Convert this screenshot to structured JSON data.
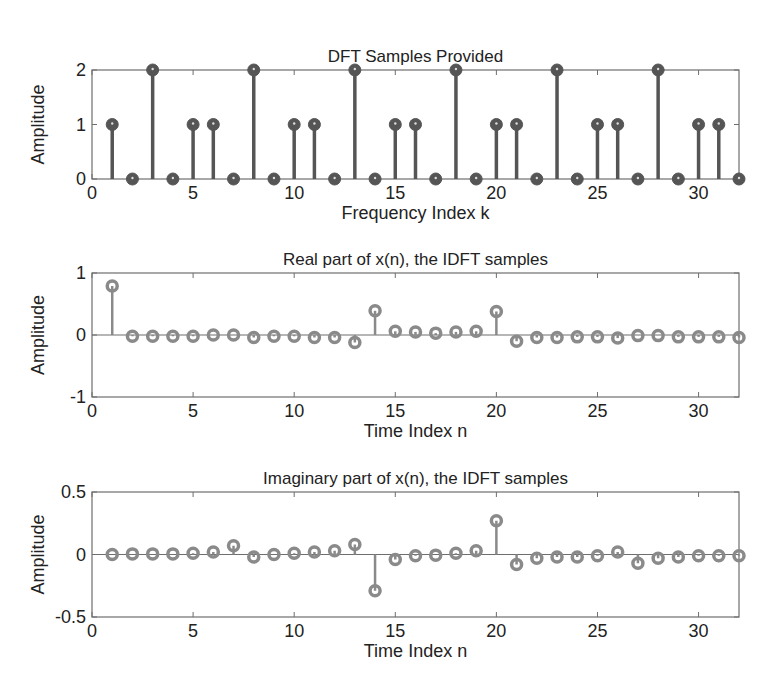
{
  "figure": {
    "background": "#ffffff",
    "axis_color": "#6e6e6e",
    "text_color": "#222222"
  },
  "chart_data": [
    {
      "id": "dft",
      "type": "stem",
      "title": "DFT Samples Provided",
      "xlabel": "Frequency Index k",
      "ylabel": "Amplitude",
      "xlim": [
        0,
        32
      ],
      "ylim": [
        0,
        2
      ],
      "xticks": [
        0,
        5,
        10,
        15,
        20,
        25,
        30
      ],
      "yticks": [
        0,
        1,
        2
      ],
      "ytick_labels": [
        "0",
        "1",
        "2"
      ],
      "marker": "filled",
      "color": "#555555",
      "box": {
        "left": 92,
        "top": 70,
        "right": 739,
        "bottom": 179
      },
      "x": [
        1,
        2,
        3,
        4,
        5,
        6,
        7,
        8,
        9,
        10,
        11,
        12,
        13,
        14,
        15,
        16,
        17,
        18,
        19,
        20,
        21,
        22,
        23,
        24,
        25,
        26,
        27,
        28,
        29,
        30,
        31,
        32
      ],
      "values": [
        1,
        0,
        2,
        0,
        1,
        1,
        0,
        2,
        0,
        1,
        1,
        0,
        2,
        0,
        1,
        1,
        0,
        2,
        0,
        1,
        1,
        0,
        2,
        0,
        1,
        1,
        0,
        2,
        0,
        1,
        1,
        0
      ]
    },
    {
      "id": "real",
      "type": "stem",
      "title": "Real part of x(n), the IDFT samples",
      "xlabel": "Time Index n",
      "ylabel": "Amplitude",
      "xlim": [
        0,
        32
      ],
      "ylim": [
        -1,
        1
      ],
      "xticks": [
        0,
        5,
        10,
        15,
        20,
        25,
        30
      ],
      "yticks": [
        -1,
        0,
        1
      ],
      "ytick_labels": [
        "-1",
        "0",
        "1"
      ],
      "marker": "open",
      "color": "#8a8a8a",
      "box": {
        "left": 92,
        "top": 273,
        "right": 739,
        "bottom": 397
      },
      "x": [
        1,
        2,
        3,
        4,
        5,
        6,
        7,
        8,
        9,
        10,
        11,
        12,
        13,
        14,
        15,
        16,
        17,
        18,
        19,
        20,
        21,
        22,
        23,
        24,
        25,
        26,
        27,
        28,
        29,
        30,
        31,
        32
      ],
      "values": [
        0.79,
        -0.02,
        -0.02,
        -0.02,
        -0.02,
        0.0,
        0.0,
        -0.04,
        -0.02,
        -0.02,
        -0.04,
        -0.04,
        -0.12,
        0.39,
        0.06,
        0.05,
        0.03,
        0.05,
        0.06,
        0.38,
        -0.1,
        -0.04,
        -0.04,
        -0.03,
        -0.03,
        -0.05,
        -0.01,
        -0.01,
        -0.03,
        -0.03,
        -0.03,
        -0.04
      ]
    },
    {
      "id": "imag",
      "type": "stem",
      "title": "Imaginary part of x(n), the IDFT samples",
      "xlabel": "Time Index n",
      "ylabel": "Amplitude",
      "xlim": [
        0,
        32
      ],
      "ylim": [
        -0.5,
        0.5
      ],
      "xticks": [
        0,
        5,
        10,
        15,
        20,
        25,
        30
      ],
      "yticks": [
        -0.5,
        0,
        0.5
      ],
      "ytick_labels": [
        "-0.5",
        "0",
        "0.5"
      ],
      "marker": "open",
      "color": "#8a8a8a",
      "box": {
        "left": 92,
        "top": 492,
        "right": 739,
        "bottom": 617
      },
      "x": [
        1,
        2,
        3,
        4,
        5,
        6,
        7,
        8,
        9,
        10,
        11,
        12,
        13,
        14,
        15,
        16,
        17,
        18,
        19,
        20,
        21,
        22,
        23,
        24,
        25,
        26,
        27,
        28,
        29,
        30,
        31,
        32
      ],
      "values": [
        0.0,
        0.005,
        0.005,
        0.005,
        0.01,
        0.02,
        0.07,
        -0.02,
        0.0,
        0.01,
        0.02,
        0.03,
        0.08,
        -0.29,
        -0.04,
        -0.01,
        -0.005,
        0.01,
        0.03,
        0.27,
        -0.08,
        -0.03,
        -0.02,
        -0.02,
        -0.01,
        0.02,
        -0.07,
        -0.03,
        -0.02,
        -0.01,
        -0.01,
        -0.01
      ]
    }
  ]
}
